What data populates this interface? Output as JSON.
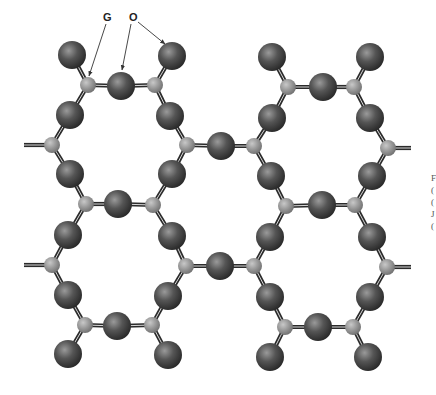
{
  "labels": {
    "g": {
      "text": "G",
      "x": 103,
      "y": 11
    },
    "o": {
      "text": "O",
      "x": 129,
      "y": 11
    }
  },
  "caption_fragments": [
    "F",
    "(",
    "(",
    "J",
    "("
  ],
  "legend": {
    "G": "small light-gray atom",
    "O": "large dark-gray atom"
  },
  "colors": {
    "o_atom_light": "#9a9a9a",
    "o_atom_mid": "#555555",
    "o_atom_dark": "#262626",
    "g_atom_light": "#c8c8c8",
    "g_atom_mid": "#9a9a9a",
    "g_atom_dark": "#6e6e6e",
    "bond": "#2b2b2b",
    "arrow": "#333333"
  },
  "arrows": [
    {
      "from": [
        106,
        24
      ],
      "to": [
        89,
        76
      ],
      "label": "G"
    },
    {
      "from": [
        131,
        24
      ],
      "to": [
        122,
        70
      ],
      "label": "O"
    },
    {
      "from": [
        138,
        22
      ],
      "to": [
        165,
        44
      ],
      "label": "O"
    }
  ],
  "g_atoms": [
    [
      88,
      85
    ],
    [
      155,
      85
    ],
    [
      52,
      145
    ],
    [
      187,
      145
    ],
    [
      86,
      204
    ],
    [
      153,
      205
    ],
    [
      288,
      87
    ],
    [
      354,
      87
    ],
    [
      254,
      146
    ],
    [
      388,
      148
    ],
    [
      286,
      206
    ],
    [
      355,
      205
    ],
    [
      52,
      265
    ],
    [
      186,
      266
    ],
    [
      85,
      325
    ],
    [
      152,
      325
    ],
    [
      254,
      266
    ],
    [
      387,
      267
    ],
    [
      285,
      327
    ],
    [
      353,
      327
    ]
  ],
  "o_atoms": [
    [
      72,
      55
    ],
    [
      121,
      86
    ],
    [
      172,
      56
    ],
    [
      70,
      115
    ],
    [
      170,
      116
    ],
    [
      70,
      174
    ],
    [
      172,
      174
    ],
    [
      118,
      204
    ],
    [
      221,
      146
    ],
    [
      272,
      57
    ],
    [
      323,
      87
    ],
    [
      370,
      57
    ],
    [
      272,
      118
    ],
    [
      370,
      118
    ],
    [
      271,
      176
    ],
    [
      372,
      176
    ],
    [
      322,
      205
    ],
    [
      68,
      235
    ],
    [
      172,
      236
    ],
    [
      68,
      295
    ],
    [
      168,
      296
    ],
    [
      117,
      326
    ],
    [
      68,
      354
    ],
    [
      168,
      355
    ],
    [
      220,
      266
    ],
    [
      270,
      237
    ],
    [
      372,
      237
    ],
    [
      270,
      297
    ],
    [
      370,
      297
    ],
    [
      318,
      327
    ],
    [
      270,
      357
    ],
    [
      368,
      357
    ]
  ],
  "bonds": [
    [
      [
        72,
        55
      ],
      [
        88,
        85
      ]
    ],
    [
      [
        88,
        85
      ],
      [
        121,
        86
      ]
    ],
    [
      [
        121,
        86
      ],
      [
        155,
        85
      ]
    ],
    [
      [
        155,
        85
      ],
      [
        172,
        56
      ]
    ],
    [
      [
        88,
        85
      ],
      [
        70,
        115
      ]
    ],
    [
      [
        155,
        85
      ],
      [
        170,
        116
      ]
    ],
    [
      [
        70,
        115
      ],
      [
        52,
        145
      ]
    ],
    [
      [
        170,
        116
      ],
      [
        187,
        145
      ]
    ],
    [
      [
        52,
        145
      ],
      [
        70,
        174
      ]
    ],
    [
      [
        187,
        145
      ],
      [
        172,
        174
      ]
    ],
    [
      [
        70,
        174
      ],
      [
        86,
        204
      ]
    ],
    [
      [
        172,
        174
      ],
      [
        153,
        205
      ]
    ],
    [
      [
        86,
        204
      ],
      [
        118,
        204
      ]
    ],
    [
      [
        118,
        204
      ],
      [
        153,
        205
      ]
    ],
    [
      [
        187,
        145
      ],
      [
        221,
        146
      ]
    ],
    [
      [
        221,
        146
      ],
      [
        254,
        146
      ]
    ],
    [
      [
        272,
        57
      ],
      [
        288,
        87
      ]
    ],
    [
      [
        288,
        87
      ],
      [
        323,
        87
      ]
    ],
    [
      [
        323,
        87
      ],
      [
        354,
        87
      ]
    ],
    [
      [
        354,
        87
      ],
      [
        370,
        57
      ]
    ],
    [
      [
        288,
        87
      ],
      [
        272,
        118
      ]
    ],
    [
      [
        354,
        87
      ],
      [
        370,
        118
      ]
    ],
    [
      [
        272,
        118
      ],
      [
        254,
        146
      ]
    ],
    [
      [
        370,
        118
      ],
      [
        388,
        148
      ]
    ],
    [
      [
        254,
        146
      ],
      [
        271,
        176
      ]
    ],
    [
      [
        388,
        148
      ],
      [
        372,
        176
      ]
    ],
    [
      [
        271,
        176
      ],
      [
        286,
        206
      ]
    ],
    [
      [
        372,
        176
      ],
      [
        355,
        205
      ]
    ],
    [
      [
        286,
        206
      ],
      [
        322,
        205
      ]
    ],
    [
      [
        322,
        205
      ],
      [
        355,
        205
      ]
    ],
    [
      [
        86,
        204
      ],
      [
        68,
        235
      ]
    ],
    [
      [
        153,
        205
      ],
      [
        172,
        236
      ]
    ],
    [
      [
        68,
        235
      ],
      [
        52,
        265
      ]
    ],
    [
      [
        172,
        236
      ],
      [
        186,
        266
      ]
    ],
    [
      [
        52,
        265
      ],
      [
        68,
        295
      ]
    ],
    [
      [
        186,
        266
      ],
      [
        168,
        296
      ]
    ],
    [
      [
        68,
        295
      ],
      [
        85,
        325
      ]
    ],
    [
      [
        168,
        296
      ],
      [
        152,
        325
      ]
    ],
    [
      [
        85,
        325
      ],
      [
        117,
        326
      ]
    ],
    [
      [
        117,
        326
      ],
      [
        152,
        325
      ]
    ],
    [
      [
        85,
        325
      ],
      [
        68,
        354
      ]
    ],
    [
      [
        152,
        325
      ],
      [
        168,
        355
      ]
    ],
    [
      [
        186,
        266
      ],
      [
        220,
        266
      ]
    ],
    [
      [
        220,
        266
      ],
      [
        254,
        266
      ]
    ],
    [
      [
        286,
        206
      ],
      [
        270,
        237
      ]
    ],
    [
      [
        355,
        205
      ],
      [
        372,
        237
      ]
    ],
    [
      [
        270,
        237
      ],
      [
        254,
        266
      ]
    ],
    [
      [
        372,
        237
      ],
      [
        387,
        267
      ]
    ],
    [
      [
        254,
        266
      ],
      [
        270,
        297
      ]
    ],
    [
      [
        387,
        267
      ],
      [
        370,
        297
      ]
    ],
    [
      [
        270,
        297
      ],
      [
        285,
        327
      ]
    ],
    [
      [
        370,
        297
      ],
      [
        353,
        327
      ]
    ],
    [
      [
        285,
        327
      ],
      [
        318,
        327
      ]
    ],
    [
      [
        318,
        327
      ],
      [
        353,
        327
      ]
    ],
    [
      [
        285,
        327
      ],
      [
        270,
        357
      ]
    ],
    [
      [
        353,
        327
      ],
      [
        368,
        357
      ]
    ]
  ],
  "stubs": [
    [
      [
        24,
        145
      ],
      [
        52,
        145
      ]
    ],
    [
      [
        388,
        148
      ],
      [
        411,
        148
      ]
    ],
    [
      [
        24,
        265
      ],
      [
        52,
        265
      ]
    ],
    [
      [
        387,
        267
      ],
      [
        411,
        267
      ]
    ]
  ]
}
